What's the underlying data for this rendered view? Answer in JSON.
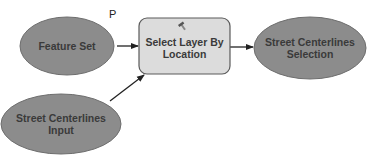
{
  "diagram": {
    "marker_label": "P",
    "nodes": [
      {
        "id": "feature-set",
        "label": "Feature Set",
        "shape": "ellipse",
        "fill": "#8c8c8c"
      },
      {
        "id": "select-layer",
        "label": "Select Layer By Location",
        "shape": "rounded-rect",
        "fill": "#dcdcdc",
        "icon": "hammer-icon"
      },
      {
        "id": "street-selection",
        "label": "Street Centerlines Selection",
        "shape": "ellipse",
        "fill": "#8c8c8c"
      },
      {
        "id": "street-input",
        "label": "Street Centerlines Input",
        "shape": "ellipse",
        "fill": "#8c8c8c"
      }
    ],
    "edges": [
      {
        "from": "feature-set",
        "to": "select-layer"
      },
      {
        "from": "street-input",
        "to": "select-layer"
      },
      {
        "from": "select-layer",
        "to": "street-selection"
      }
    ]
  }
}
